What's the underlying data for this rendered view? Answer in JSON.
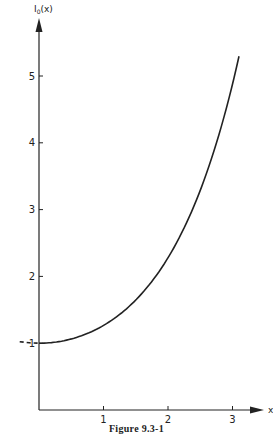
{
  "caption": "Figure 9.3-1",
  "chart_data": {
    "type": "line",
    "title": "",
    "xlabel": "x",
    "ylabel": "I0(x)",
    "xlim": [
      0,
      3.1
    ],
    "ylim": [
      0,
      5.5
    ],
    "x_ticks": [
      "1",
      "2",
      "3"
    ],
    "y_ticks": [
      "1",
      "2",
      "3",
      "4",
      "5"
    ],
    "grid": false,
    "legend": null,
    "series": [
      {
        "name": "I0(x)",
        "style": "solid",
        "x": [
          0,
          0.25,
          0.5,
          0.75,
          1.0,
          1.25,
          1.5,
          1.75,
          2.0,
          2.25,
          2.5,
          2.75,
          3.0,
          3.1
        ],
        "y": [
          1.0,
          1.016,
          1.063,
          1.146,
          1.266,
          1.429,
          1.647,
          1.93,
          2.28,
          2.718,
          3.29,
          4.01,
          4.881,
          5.3
        ]
      },
      {
        "name": "I0(x) negative-x continuation",
        "style": "dashed",
        "x": [
          -0.3,
          -0.15,
          0
        ],
        "y": [
          1.023,
          1.006,
          1.0
        ]
      }
    ]
  }
}
